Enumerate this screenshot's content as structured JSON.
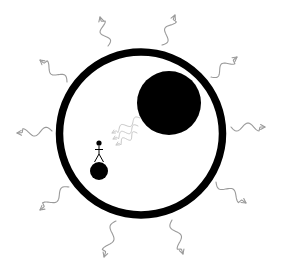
{
  "canvas": {
    "width": 286,
    "height": 275,
    "background": "#ffffff"
  },
  "colors": {
    "ink": "#000000",
    "wave_outer": "#9a9a9a",
    "wave_inner": "#c8c8c8"
  },
  "ring": {
    "cx": 141,
    "cy": 133.5,
    "r": 81.5,
    "stroke_width": 7.5
  },
  "large_body": {
    "cx": 169,
    "cy": 103,
    "r": 32
  },
  "small_ball": {
    "cx": 99,
    "cy": 171,
    "r": 9
  },
  "stick_figure": {
    "head": {
      "cx": 99,
      "cy": 143,
      "r": 2.6
    },
    "body_top": [
      99,
      145.5
    ],
    "body_bottom": [
      99,
      154
    ],
    "arms": [
      [
        95,
        149.5
      ],
      [
        103,
        149.5
      ]
    ],
    "legs": [
      [
        [
          99,
          154
        ],
        [
          94.5,
          162
        ]
      ],
      [
        [
          99,
          154
        ],
        [
          103.5,
          162
        ]
      ]
    ]
  },
  "outer_waves": [
    {
      "name": "wave-top-left",
      "from": [
        108,
        46
      ],
      "to": [
        100,
        17
      ]
    },
    {
      "name": "wave-top-right",
      "from": [
        162,
        45
      ],
      "to": [
        175,
        15
      ]
    },
    {
      "name": "wave-upper-right",
      "from": [
        211,
        77
      ],
      "to": [
        237,
        57
      ]
    },
    {
      "name": "wave-right",
      "from": [
        231,
        127
      ],
      "to": [
        265,
        127
      ]
    },
    {
      "name": "wave-lower-right",
      "from": [
        216,
        182
      ],
      "to": [
        246,
        203
      ]
    },
    {
      "name": "wave-bottom-right",
      "from": [
        172,
        220
      ],
      "to": [
        183,
        254
      ]
    },
    {
      "name": "wave-bottom-left",
      "from": [
        116,
        221
      ],
      "to": [
        104,
        257
      ]
    },
    {
      "name": "wave-lower-left",
      "from": [
        69,
        187
      ],
      "to": [
        40,
        210
      ]
    },
    {
      "name": "wave-left",
      "from": [
        52,
        131
      ],
      "to": [
        17,
        133
      ]
    },
    {
      "name": "wave-upper-left",
      "from": [
        67,
        82
      ],
      "to": [
        40,
        60
      ]
    }
  ],
  "inner_waves": [
    {
      "name": "inner-wave-1",
      "from": [
        140,
        118
      ],
      "to": [
        112,
        133
      ]
    },
    {
      "name": "inner-wave-2",
      "from": [
        138,
        126
      ],
      "to": [
        113,
        139
      ]
    },
    {
      "name": "inner-wave-3",
      "from": [
        137,
        133
      ],
      "to": [
        116,
        145
      ]
    }
  ]
}
